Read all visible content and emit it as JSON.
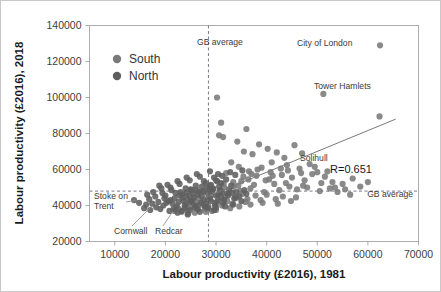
{
  "figure": {
    "background_color": "#ffffff",
    "border_color": "#c9c9c9"
  },
  "axes": {
    "x_title": "Labour productivity (£2016), 1981",
    "y_title": "Labour productivity (£2016), 2018",
    "x_ticks": [
      "10000",
      "20000",
      "30000",
      "40000",
      "50000",
      "60000",
      "70000"
    ],
    "y_ticks": [
      "20000",
      "40000",
      "60000",
      "80000",
      "100000",
      "120000",
      "140000"
    ]
  },
  "legend": {
    "items": [
      {
        "label": "South",
        "color": "#7a7a7a"
      },
      {
        "label": "North",
        "color": "#5e5e5e"
      }
    ]
  },
  "annotations": {
    "gb_average_vertical": "GB average",
    "gb_average_horizontal": "GB average",
    "city_of_london": "City of London",
    "tower_hamlets": "Tower Hamlets",
    "solihull": "Solihull",
    "stoke_on_trent_line1": "Stoke on",
    "stoke_on_trent_line2": "Trent",
    "cornwall": "Cornwall",
    "redcar": "Redcar",
    "correlation": "R=0.651"
  },
  "chart_data": {
    "type": "scatter",
    "title": "",
    "xlabel": "Labour productivity (£2016), 1981",
    "ylabel": "Labour productivity (£2016), 2018",
    "xlim": [
      5000,
      70000
    ],
    "ylim": [
      20000,
      140000
    ],
    "xticks": [
      10000,
      20000,
      30000,
      40000,
      50000,
      60000,
      70000
    ],
    "yticks": [
      20000,
      40000,
      60000,
      80000,
      100000,
      120000,
      140000
    ],
    "grid": false,
    "legend_position": "upper-left",
    "correlation_r": 0.651,
    "reference_lines": [
      {
        "orientation": "vertical",
        "value": 28500,
        "label": "GB average",
        "style": "dashed"
      },
      {
        "orientation": "horizontal",
        "value": 48000,
        "label": "GB average",
        "style": "dashed"
      }
    ],
    "trend_line": {
      "x": [
        27500,
        65500
      ],
      "y": [
        44000,
        88000
      ]
    },
    "labeled_points": [
      {
        "name": "City of London",
        "x": 62400,
        "y": 129000
      },
      {
        "name": "Tower Hamlets",
        "x": 51200,
        "y": 102000
      },
      {
        "name": "Solihull",
        "x": 43500,
        "y": 66500
      },
      {
        "name": "Stoke on Trent",
        "x": 25200,
        "y": 42000
      },
      {
        "name": "Cornwall",
        "x": 26800,
        "y": 36500
      },
      {
        "name": "Redcar",
        "x": 29600,
        "y": 37500
      }
    ],
    "series": [
      {
        "name": "South",
        "color": "#7a7a7a",
        "points": [
          [
            62400,
            129000
          ],
          [
            51200,
            102000
          ],
          [
            62300,
            89500
          ],
          [
            30200,
            100000
          ],
          [
            31000,
            86000
          ],
          [
            30600,
            79000
          ],
          [
            31400,
            78000
          ],
          [
            36000,
            82500
          ],
          [
            34200,
            75500
          ],
          [
            38500,
            74000
          ],
          [
            40200,
            71500
          ],
          [
            35500,
            70000
          ],
          [
            37200,
            68500
          ],
          [
            42000,
            69500
          ],
          [
            43500,
            66500
          ],
          [
            45500,
            73500
          ],
          [
            47000,
            69000
          ],
          [
            41000,
            64000
          ],
          [
            44000,
            62500
          ],
          [
            46500,
            60500
          ],
          [
            48500,
            63000
          ],
          [
            50000,
            58500
          ],
          [
            39000,
            61000
          ],
          [
            36500,
            59000
          ],
          [
            34500,
            61500
          ],
          [
            33000,
            64000
          ],
          [
            32000,
            58000
          ],
          [
            43000,
            57000
          ],
          [
            45000,
            55500
          ],
          [
            47500,
            54000
          ],
          [
            49000,
            57500
          ],
          [
            51500,
            56000
          ],
          [
            53000,
            53000
          ],
          [
            40500,
            54500
          ],
          [
            38000,
            56500
          ],
          [
            35000,
            53500
          ],
          [
            37500,
            51500
          ],
          [
            41500,
            52000
          ],
          [
            44500,
            50500
          ],
          [
            46000,
            49000
          ],
          [
            48000,
            50000
          ],
          [
            50500,
            48000
          ],
          [
            52500,
            49500
          ],
          [
            42500,
            48500
          ],
          [
            39500,
            47500
          ],
          [
            36800,
            49500
          ],
          [
            34800,
            48000
          ],
          [
            33500,
            50500
          ],
          [
            31500,
            52000
          ],
          [
            30000,
            54000
          ],
          [
            32500,
            47000
          ],
          [
            35200,
            46500
          ],
          [
            37800,
            45500
          ],
          [
            40000,
            46000
          ],
          [
            43200,
            45000
          ],
          [
            45800,
            44500
          ],
          [
            55000,
            52000
          ],
          [
            57000,
            55000
          ],
          [
            58500,
            50500
          ],
          [
            60000,
            53000
          ],
          [
            54000,
            47500
          ],
          [
            56500,
            46000
          ],
          [
            30800,
            47000
          ],
          [
            29500,
            49000
          ],
          [
            28800,
            51000
          ],
          [
            33800,
            44000
          ],
          [
            36200,
            43500
          ],
          [
            38800,
            43000
          ],
          [
            41800,
            43500
          ],
          [
            44800,
            42500
          ],
          [
            31800,
            45000
          ],
          [
            34000,
            44500
          ],
          [
            29000,
            45500
          ],
          [
            27500,
            47500
          ],
          [
            26500,
            44000
          ],
          [
            32200,
            42500
          ],
          [
            35800,
            42000
          ],
          [
            39200,
            41500
          ],
          [
            42200,
            41000
          ],
          [
            30400,
            43000
          ],
          [
            28200,
            43500
          ],
          [
            26000,
            42000
          ],
          [
            33200,
            41000
          ],
          [
            36800,
            40500
          ],
          [
            29800,
            41500
          ],
          [
            27000,
            40500
          ],
          [
            31200,
            40000
          ],
          [
            34600,
            39500
          ],
          [
            25500,
            43000
          ],
          [
            24800,
            41000
          ],
          [
            28500,
            39500
          ],
          [
            32800,
            38500
          ],
          [
            25000,
            39000
          ],
          [
            23800,
            40000
          ],
          [
            27800,
            38000
          ],
          [
            30000,
            37500
          ],
          [
            24200,
            37500
          ],
          [
            26200,
            38500
          ],
          [
            29200,
            37000
          ],
          [
            22500,
            38500
          ],
          [
            23200,
            36500
          ],
          [
            25800,
            36000
          ],
          [
            28000,
            36500
          ],
          [
            21800,
            37000
          ],
          [
            24500,
            35500
          ],
          [
            31600,
            50000
          ],
          [
            33400,
            53000
          ],
          [
            35400,
            56000
          ],
          [
            37000,
            57500
          ],
          [
            38200,
            60000
          ],
          [
            40800,
            58500
          ],
          [
            42800,
            60500
          ],
          [
            46800,
            58000
          ],
          [
            49500,
            61500
          ],
          [
            52000,
            59000
          ],
          [
            44200,
            59500
          ],
          [
            41200,
            56500
          ],
          [
            39800,
            54000
          ],
          [
            43800,
            52500
          ],
          [
            47200,
            51000
          ],
          [
            50800,
            52500
          ],
          [
            53500,
            50000
          ],
          [
            55500,
            49000
          ],
          [
            36400,
            54500
          ],
          [
            34400,
            51000
          ]
        ]
      },
      {
        "name": "North",
        "color": "#5e5e5e",
        "points": [
          [
            25200,
            42000
          ],
          [
            26800,
            36500
          ],
          [
            29600,
            37500
          ],
          [
            27200,
            45000
          ],
          [
            28400,
            46500
          ],
          [
            29200,
            48000
          ],
          [
            30000,
            45500
          ],
          [
            26400,
            46000
          ],
          [
            25600,
            44500
          ],
          [
            24400,
            43500
          ],
          [
            23600,
            42500
          ],
          [
            27600,
            43000
          ],
          [
            28800,
            44000
          ],
          [
            30400,
            46000
          ],
          [
            31000,
            44500
          ],
          [
            29000,
            42500
          ],
          [
            27000,
            41500
          ],
          [
            25000,
            42500
          ],
          [
            24000,
            40500
          ],
          [
            26000,
            40000
          ],
          [
            28000,
            41000
          ],
          [
            30200,
            42000
          ],
          [
            31600,
            43000
          ],
          [
            32400,
            45500
          ],
          [
            33200,
            47000
          ],
          [
            31200,
            47500
          ],
          [
            29400,
            49500
          ],
          [
            27400,
            48000
          ],
          [
            25400,
            46500
          ],
          [
            23400,
            44500
          ],
          [
            22600,
            42000
          ],
          [
            24600,
            45500
          ],
          [
            26600,
            47500
          ],
          [
            28600,
            49000
          ],
          [
            30600,
            50500
          ],
          [
            32600,
            49000
          ],
          [
            34000,
            47500
          ],
          [
            33600,
            44000
          ],
          [
            31400,
            41500
          ],
          [
            29800,
            40000
          ],
          [
            27800,
            39500
          ],
          [
            25800,
            39000
          ],
          [
            23800,
            38500
          ],
          [
            22200,
            39500
          ],
          [
            21400,
            41000
          ],
          [
            24200,
            47000
          ],
          [
            26200,
            48500
          ],
          [
            28200,
            50000
          ],
          [
            30800,
            48500
          ],
          [
            32200,
            46500
          ],
          [
            22800,
            45500
          ],
          [
            21000,
            43000
          ],
          [
            20200,
            41500
          ],
          [
            23000,
            47500
          ],
          [
            25000,
            49000
          ],
          [
            19600,
            40000
          ],
          [
            21600,
            38000
          ],
          [
            23200,
            37000
          ],
          [
            24800,
            37500
          ],
          [
            26400,
            38000
          ],
          [
            28400,
            38500
          ],
          [
            30000,
            39000
          ],
          [
            31800,
            39500
          ],
          [
            33400,
            40500
          ],
          [
            35000,
            42500
          ],
          [
            34600,
            45000
          ],
          [
            36000,
            46500
          ],
          [
            35600,
            48500
          ],
          [
            33000,
            51000
          ],
          [
            31000,
            52500
          ],
          [
            29000,
            51500
          ],
          [
            27200,
            50500
          ],
          [
            25200,
            48500
          ],
          [
            23400,
            46000
          ],
          [
            21800,
            44000
          ],
          [
            20600,
            42500
          ],
          [
            19800,
            44000
          ],
          [
            18600,
            42000
          ],
          [
            20000,
            45500
          ],
          [
            22000,
            47000
          ],
          [
            24000,
            49500
          ],
          [
            26000,
            51000
          ],
          [
            28000,
            52500
          ],
          [
            30200,
            53500
          ],
          [
            32000,
            54500
          ],
          [
            18200,
            39000
          ],
          [
            19000,
            38000
          ],
          [
            20800,
            37000
          ],
          [
            22400,
            36000
          ],
          [
            24400,
            35000
          ],
          [
            17400,
            41000
          ],
          [
            16800,
            43500
          ],
          [
            18000,
            45000
          ],
          [
            19400,
            47000
          ],
          [
            21200,
            48500
          ],
          [
            15800,
            38500
          ],
          [
            17000,
            37500
          ],
          [
            16200,
            40500
          ],
          [
            14800,
            41500
          ],
          [
            13800,
            43000
          ],
          [
            27600,
            53500
          ],
          [
            29600,
            55500
          ],
          [
            31200,
            56500
          ],
          [
            26800,
            56000
          ],
          [
            24800,
            54000
          ],
          [
            22800,
            52000
          ],
          [
            21000,
            50000
          ],
          [
            19200,
            49500
          ],
          [
            17600,
            47500
          ],
          [
            16400,
            46000
          ],
          [
            33800,
            57000
          ],
          [
            35200,
            59500
          ],
          [
            32800,
            58500
          ],
          [
            30400,
            57500
          ],
          [
            28800,
            59000
          ],
          [
            26200,
            57500
          ],
          [
            24200,
            55500
          ],
          [
            22400,
            53500
          ],
          [
            20400,
            51500
          ],
          [
            18800,
            51000
          ]
        ]
      }
    ]
  }
}
